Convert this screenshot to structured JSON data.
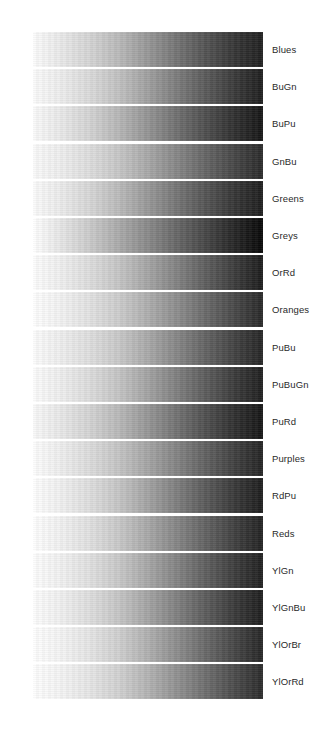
{
  "figure": {
    "name": "sequential-colormap-reference",
    "background_color": "#ffffff",
    "label_color": "#2a2a2a",
    "bar_left_px": 33,
    "bar_width_px": 230,
    "bar_height_px": 35,
    "row_pitch_px": 37.2,
    "first_row_top_px": 32,
    "label_left_px": 272
  },
  "chart_data": {
    "type": "heatmap",
    "title": "",
    "subtitle": "",
    "xlabel": "",
    "ylabel": "",
    "legend_position": "right",
    "grid": false,
    "orientation": "horizontal",
    "axis_ranges": {
      "x": [
        0,
        1
      ],
      "y": [
        0,
        18
      ]
    },
    "gradient_stops_percent": [
      0,
      12.5,
      25,
      37.5,
      50,
      62.5,
      75,
      87.5,
      100
    ],
    "categories": [
      "Blues",
      "BuGn",
      "BuPu",
      "GnBu",
      "Greens",
      "Greys",
      "OrRd",
      "Oranges",
      "PuBu",
      "PuBuGn",
      "PuRd",
      "Purples",
      "RdPu",
      "Reds",
      "YlGn",
      "YlGnBu",
      "YlOrBr",
      "YlOrRd"
    ],
    "series": [
      {
        "name": "Blues",
        "label": "Blues",
        "row": 1,
        "luminance_values": [
          252,
          233,
          212,
          185,
          151,
          116,
          83,
          54,
          32
        ],
        "grays": [
          "#fcfcfc",
          "#e9e9e9",
          "#d4d4d4",
          "#b9b9b9",
          "#979797",
          "#747474",
          "#535353",
          "#363636",
          "#202020"
        ]
      },
      {
        "name": "BuGn",
        "label": "BuGn",
        "row": 2,
        "luminance_values": [
          251,
          237,
          218,
          193,
          160,
          124,
          90,
          58,
          30
        ],
        "grays": [
          "#fbfbfb",
          "#ededed",
          "#dadada",
          "#c1c1c1",
          "#a0a0a0",
          "#7c7c7c",
          "#5a5a5a",
          "#3a3a3a",
          "#1e1e1e"
        ]
      },
      {
        "name": "BuPu",
        "label": "BuPu",
        "row": 3,
        "luminance_values": [
          250,
          233,
          211,
          182,
          148,
          112,
          78,
          48,
          22
        ],
        "grays": [
          "#fafafa",
          "#e9e9e9",
          "#d3d3d3",
          "#b6b6b6",
          "#949494",
          "#707070",
          "#4e4e4e",
          "#303030",
          "#161616"
        ]
      },
      {
        "name": "GnBu",
        "label": "GnBu",
        "row": 4,
        "luminance_values": [
          250,
          238,
          221,
          198,
          168,
          134,
          101,
          70,
          42
        ],
        "grays": [
          "#fafafa",
          "#eeeeee",
          "#dddddd",
          "#c6c6c6",
          "#a8a8a8",
          "#868686",
          "#656565",
          "#464646",
          "#2a2a2a"
        ]
      },
      {
        "name": "Greens",
        "label": "Greens",
        "row": 5,
        "luminance_values": [
          251,
          235,
          214,
          186,
          152,
          117,
          84,
          54,
          30
        ],
        "grays": [
          "#fbfbfb",
          "#ebebeb",
          "#d6d6d6",
          "#bababa",
          "#989898",
          "#757575",
          "#545454",
          "#363636",
          "#1e1e1e"
        ]
      },
      {
        "name": "Greys",
        "label": "Greys",
        "row": 6,
        "luminance_values": [
          255,
          230,
          202,
          170,
          137,
          103,
          70,
          38,
          8
        ],
        "grays": [
          "#ffffff",
          "#e6e6e6",
          "#cacaca",
          "#aaaaaa",
          "#898989",
          "#676767",
          "#464646",
          "#262626",
          "#080808"
        ]
      },
      {
        "name": "OrRd",
        "label": "OrRd",
        "row": 7,
        "luminance_values": [
          253,
          239,
          221,
          197,
          165,
          130,
          94,
          60,
          28
        ],
        "grays": [
          "#fdfdfd",
          "#efefef",
          "#dddddd",
          "#c5c5c5",
          "#a5a5a5",
          "#828282",
          "#5e5e5e",
          "#3c3c3c",
          "#1c1c1c"
        ]
      },
      {
        "name": "Oranges",
        "label": "Oranges",
        "row": 8,
        "luminance_values": [
          254,
          242,
          226,
          204,
          174,
          141,
          106,
          72,
          40
        ],
        "grays": [
          "#fefefe",
          "#f2f2f2",
          "#e2e2e2",
          "#cccccc",
          "#aeaeae",
          "#8d8d8d",
          "#6a6a6a",
          "#484848",
          "#282828"
        ]
      },
      {
        "name": "PuBu",
        "label": "PuBu",
        "row": 9,
        "luminance_values": [
          252,
          238,
          222,
          200,
          169,
          134,
          99,
          66,
          37
        ],
        "grays": [
          "#fcfcfc",
          "#eeeeee",
          "#dedede",
          "#c8c8c8",
          "#a9a9a9",
          "#868686",
          "#636363",
          "#424242",
          "#252525"
        ]
      },
      {
        "name": "PuBuGn",
        "label": "PuBuGn",
        "row": 10,
        "luminance_values": [
          252,
          238,
          220,
          196,
          163,
          127,
          92,
          59,
          31
        ],
        "grays": [
          "#fcfcfc",
          "#eeeeee",
          "#dcdcdc",
          "#c4c4c4",
          "#a3a3a3",
          "#7f7f7f",
          "#5c5c5c",
          "#3b3b3b",
          "#1f1f1f"
        ]
      },
      {
        "name": "PuRd",
        "label": "PuRd",
        "row": 11,
        "luminance_values": [
          249,
          232,
          211,
          184,
          150,
          114,
          79,
          48,
          22
        ],
        "grays": [
          "#f9f9f9",
          "#e8e8e8",
          "#d3d3d3",
          "#b8b8b8",
          "#969696",
          "#727272",
          "#4f4f4f",
          "#303030",
          "#161616"
        ]
      },
      {
        "name": "Purples",
        "label": "Purples",
        "row": 12,
        "luminance_values": [
          253,
          238,
          220,
          196,
          165,
          131,
          97,
          64,
          36
        ],
        "grays": [
          "#fdfdfd",
          "#eeeeee",
          "#dcdcdc",
          "#c4c4c4",
          "#a5a5a5",
          "#838383",
          "#616161",
          "#404040",
          "#242424"
        ]
      },
      {
        "name": "RdPu",
        "label": "RdPu",
        "row": 13,
        "luminance_values": [
          254,
          240,
          222,
          197,
          163,
          126,
          90,
          57,
          29
        ],
        "grays": [
          "#fefefe",
          "#f0f0f0",
          "#dedede",
          "#c5c5c5",
          "#a3a3a3",
          "#7e7e7e",
          "#5a5a5a",
          "#393939",
          "#1d1d1d"
        ]
      },
      {
        "name": "Reds",
        "label": "Reds",
        "row": 14,
        "luminance_values": [
          254,
          241,
          224,
          200,
          168,
          133,
          98,
          64,
          34
        ],
        "grays": [
          "#fefefe",
          "#f1f1f1",
          "#e0e0e0",
          "#c8c8c8",
          "#a8a8a8",
          "#858585",
          "#626262",
          "#404040",
          "#222222"
        ]
      },
      {
        "name": "YlGn",
        "label": "YlGn",
        "row": 15,
        "luminance_values": [
          253,
          241,
          224,
          200,
          167,
          131,
          95,
          61,
          32
        ],
        "grays": [
          "#fdfdfd",
          "#f1f1f1",
          "#e0e0e0",
          "#c8c8c8",
          "#a7a7a7",
          "#838383",
          "#5f5f5f",
          "#3d3d3d",
          "#202020"
        ]
      },
      {
        "name": "YlGnBu",
        "label": "YlGnBu",
        "row": 16,
        "luminance_values": [
          253,
          240,
          222,
          197,
          164,
          128,
          92,
          58,
          30
        ],
        "grays": [
          "#fdfdfd",
          "#f0f0f0",
          "#dedede",
          "#c5c5c5",
          "#a4a4a4",
          "#808080",
          "#5c5c5c",
          "#3a3a3a",
          "#1e1e1e"
        ]
      },
      {
        "name": "YlOrBr",
        "label": "YlOrBr",
        "row": 17,
        "luminance_values": [
          254,
          244,
          229,
          207,
          176,
          141,
          105,
          70,
          38
        ],
        "grays": [
          "#fefefe",
          "#f4f4f4",
          "#e5e5e5",
          "#cfcfcf",
          "#b0b0b0",
          "#8d8d8d",
          "#696969",
          "#464646",
          "#262626"
        ]
      },
      {
        "name": "YlOrRd",
        "label": "YlOrRd",
        "row": 18,
        "luminance_values": [
          254,
          244,
          230,
          209,
          179,
          145,
          110,
          75,
          43
        ],
        "grays": [
          "#fefefe",
          "#f4f4f4",
          "#e6e6e6",
          "#d1d1d1",
          "#b3b3b3",
          "#919191",
          "#6e6e6e",
          "#4b4b4b",
          "#2b2b2b"
        ]
      }
    ]
  }
}
